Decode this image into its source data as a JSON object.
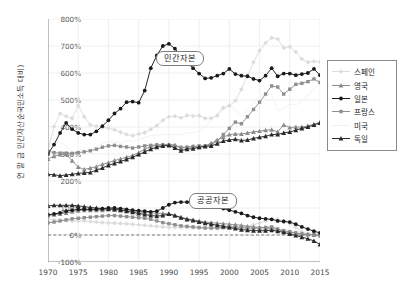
{
  "chart_data": {
    "type": "line",
    "title": "",
    "xlabel": "",
    "ylabel": "연 말 금 민간자산순국민소득 대비)",
    "xlim": [
      1970,
      2015
    ],
    "ylim": [
      -100,
      800
    ],
    "ytick_step": 100,
    "xtick_step": 5,
    "grid": true,
    "zero_line": true,
    "legend_position": "right",
    "xticks": [
      "1970",
      "1975",
      "1980",
      "1985",
      "1990",
      "1995",
      "2000",
      "2005",
      "2010",
      "2015"
    ],
    "yticks": [
      "-100%",
      "0%",
      "100%",
      "200%",
      "300%",
      "400%",
      "500%",
      "600%",
      "700%",
      "800%"
    ],
    "annotations": [
      {
        "text": "민간자본",
        "x": 1991.5,
        "y": 660
      },
      {
        "text": "공공자본",
        "x": 1997.0,
        "y": 132
      }
    ],
    "x": [
      1970,
      1971,
      1972,
      1973,
      1974,
      1975,
      1976,
      1977,
      1978,
      1979,
      1980,
      1981,
      1982,
      1983,
      1984,
      1985,
      1986,
      1987,
      1988,
      1989,
      1990,
      1991,
      1992,
      1993,
      1994,
      1995,
      1996,
      1997,
      1998,
      1999,
      2000,
      2001,
      2002,
      2003,
      2004,
      2005,
      2006,
      2007,
      2008,
      2009,
      2010,
      2011,
      2012,
      2013,
      2014,
      2015
    ],
    "series": [
      {
        "name": "스페인",
        "group": "private",
        "marker": "diamond",
        "color": "#dcdcdc",
        "values": [
          312,
          402,
          450,
          440,
          432,
          480,
          438,
          408,
          403,
          398,
          396,
          390,
          381,
          372,
          368,
          374,
          379,
          392,
          405,
          425,
          438,
          440,
          434,
          443,
          441,
          442,
          432,
          432,
          442,
          470,
          479,
          497,
          540,
          590,
          640,
          683,
          712,
          730,
          726,
          693,
          697,
          678,
          652,
          640,
          643,
          641
        ]
      },
      {
        "name": "영국",
        "group": "private",
        "marker": "triangle",
        "color": "#8c8c8c",
        "values": [
          282,
          292,
          298,
          300,
          275,
          252,
          243,
          248,
          253,
          262,
          268,
          276,
          282,
          288,
          295,
          305,
          318,
          328,
          332,
          334,
          335,
          334,
          322,
          325,
          328,
          325,
          330,
          340,
          352,
          362,
          372,
          374,
          374,
          378,
          382,
          385,
          388,
          390,
          382,
          408,
          398,
          400,
          400,
          404,
          410,
          418
        ]
      },
      {
        "name": "일본",
        "group": "private",
        "marker": "circle",
        "color": "#1a1a1a",
        "values": [
          300,
          335,
          378,
          415,
          392,
          378,
          372,
          372,
          384,
          403,
          425,
          450,
          468,
          492,
          494,
          490,
          535,
          618,
          665,
          700,
          708,
          690,
          662,
          638,
          618,
          598,
          580,
          582,
          590,
          598,
          615,
          596,
          590,
          588,
          578,
          572,
          590,
          618,
          588,
          598,
          598,
          592,
          596,
          600,
          615,
          592
        ]
      },
      {
        "name": "프랑스",
        "group": "private",
        "marker": "square",
        "color": "#8f8f8f",
        "values": [
          310,
          305,
          303,
          303,
          302,
          305,
          308,
          312,
          318,
          325,
          330,
          332,
          328,
          326,
          322,
          326,
          330,
          332,
          334,
          334,
          333,
          328,
          325,
          325,
          328,
          330,
          330,
          334,
          348,
          372,
          395,
          418,
          412,
          438,
          465,
          492,
          522,
          552,
          548,
          522,
          540,
          558,
          562,
          568,
          578,
          565
        ]
      },
      {
        "name": "미국",
        "group": "private",
        "marker": "none",
        "color": "#f1f1f1",
        "values": [
          340,
          338,
          345,
          330,
          305,
          312,
          320,
          322,
          330,
          338,
          345,
          345,
          340,
          348,
          348,
          352,
          362,
          368,
          370,
          372,
          372,
          372,
          372,
          378,
          378,
          385,
          400,
          425,
          450,
          478,
          478,
          465,
          438,
          462,
          490,
          512,
          525,
          520,
          462,
          470,
          485,
          482,
          495,
          520,
          540,
          560
        ]
      },
      {
        "name": "독일",
        "group": "private",
        "marker": "triangle",
        "color": "#2a2a2a",
        "values": [
          225,
          223,
          220,
          222,
          225,
          228,
          230,
          232,
          240,
          248,
          258,
          265,
          272,
          280,
          288,
          298,
          308,
          318,
          325,
          330,
          332,
          322,
          312,
          318,
          320,
          325,
          328,
          330,
          338,
          348,
          352,
          355,
          350,
          352,
          358,
          362,
          366,
          372,
          372,
          378,
          382,
          388,
          395,
          400,
          408,
          415
        ]
      },
      {
        "name": "스페인",
        "group": "public",
        "marker": "diamond",
        "color": "#dcdcdc",
        "values": [
          58,
          56,
          55,
          54,
          52,
          52,
          52,
          50,
          48,
          46,
          45,
          44,
          43,
          42,
          40,
          38,
          36,
          34,
          32,
          30,
          28,
          28,
          28,
          28,
          27,
          26,
          26,
          26,
          25,
          25,
          25,
          26,
          28,
          32,
          38,
          45,
          52,
          58,
          58,
          52,
          42,
          28,
          12,
          2,
          -2,
          -5
        ]
      },
      {
        "name": "영국",
        "group": "public",
        "marker": "triangle",
        "color": "#8c8c8c",
        "values": [
          72,
          75,
          78,
          82,
          86,
          90,
          92,
          92,
          92,
          92,
          95,
          95,
          92,
          90,
          88,
          86,
          84,
          82,
          80,
          80,
          78,
          72,
          66,
          60,
          56,
          52,
          48,
          46,
          44,
          42,
          40,
          38,
          36,
          32,
          30,
          28,
          26,
          24,
          20,
          14,
          10,
          6,
          4,
          2,
          0,
          -2
        ]
      },
      {
        "name": "일본",
        "group": "public",
        "marker": "circle",
        "color": "#1a1a1a",
        "values": [
          75,
          78,
          82,
          88,
          92,
          95,
          95,
          95,
          95,
          98,
          100,
          100,
          98,
          95,
          92,
          90,
          88,
          86,
          88,
          100,
          112,
          120,
          122,
          122,
          120,
          120,
          118,
          112,
          105,
          98,
          92,
          86,
          80,
          72,
          66,
          62,
          60,
          58,
          52,
          50,
          48,
          40,
          30,
          22,
          14,
          8
        ]
      },
      {
        "name": "프랑스",
        "group": "public",
        "marker": "square",
        "color": "#8f8f8f",
        "values": [
          45,
          48,
          52,
          56,
          60,
          62,
          64,
          66,
          68,
          70,
          72,
          72,
          70,
          68,
          66,
          64,
          62,
          58,
          52,
          46,
          42,
          38,
          34,
          32,
          30,
          28,
          26,
          26,
          26,
          28,
          30,
          30,
          28,
          26,
          24,
          26,
          28,
          30,
          22,
          16,
          12,
          8,
          4,
          2,
          2,
          2
        ]
      },
      {
        "name": "미국",
        "group": "public",
        "marker": "none",
        "color": "#f1f1f1",
        "values": [
          52,
          52,
          52,
          52,
          50,
          50,
          50,
          48,
          46,
          45,
          44,
          42,
          40,
          40,
          38,
          36,
          34,
          32,
          32,
          30,
          30,
          28,
          28,
          26,
          26,
          25,
          24,
          24,
          23,
          22,
          22,
          22,
          24,
          26,
          28,
          30,
          32,
          32,
          28,
          24,
          20,
          16,
          12,
          10,
          8,
          8
        ]
      },
      {
        "name": "독일",
        "group": "public",
        "marker": "triangle",
        "color": "#2a2a2a",
        "values": [
          108,
          110,
          110,
          110,
          110,
          108,
          105,
          102,
          100,
          98,
          96,
          95,
          92,
          88,
          84,
          80,
          76,
          72,
          70,
          72,
          78,
          72,
          64,
          58,
          54,
          48,
          44,
          40,
          36,
          32,
          28,
          24,
          20,
          18,
          16,
          16,
          16,
          18,
          14,
          10,
          4,
          -2,
          -8,
          -14,
          -22,
          -35
        ]
      }
    ]
  },
  "legend": {
    "items": [
      {
        "label": "스페인"
      },
      {
        "label": "영국"
      },
      {
        "label": "일본"
      },
      {
        "label": "프랑스"
      },
      {
        "label": "미국"
      },
      {
        "label": "독일"
      }
    ]
  }
}
